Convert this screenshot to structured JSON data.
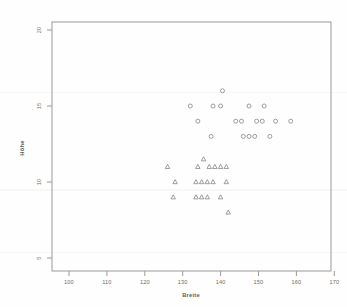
{
  "chart_data": {
    "type": "scatter",
    "title": "",
    "subtitle": "",
    "xlabel": "Breite",
    "ylabel": "Höhe",
    "xlim": [
      97,
      172
    ],
    "ylim": [
      4.2,
      20.6
    ],
    "xticks": [
      100,
      110,
      120,
      130,
      140,
      150,
      160,
      170
    ],
    "xticklabels": [
      "100",
      "110",
      "120",
      "130",
      "140",
      "150",
      "160",
      "170"
    ],
    "yticks": [
      5,
      10,
      15,
      20
    ],
    "yticklabels": [
      "5",
      "10",
      "15",
      "20"
    ],
    "grid": false,
    "legend": "none",
    "series": [
      {
        "name": "circles",
        "marker": "circle",
        "color": "#8d8d8d",
        "points": [
          [
            140.5,
            16.0
          ],
          [
            132.0,
            15.0
          ],
          [
            138.0,
            15.0
          ],
          [
            140.0,
            15.0
          ],
          [
            147.5,
            15.0
          ],
          [
            151.5,
            15.0
          ],
          [
            134.0,
            14.0
          ],
          [
            144.0,
            14.0
          ],
          [
            145.5,
            14.0
          ],
          [
            149.5,
            14.0
          ],
          [
            151.0,
            14.0
          ],
          [
            154.5,
            14.0
          ],
          [
            158.5,
            14.0
          ],
          [
            137.5,
            13.0
          ],
          [
            146.0,
            13.0
          ],
          [
            147.5,
            13.0
          ],
          [
            149.0,
            13.0
          ],
          [
            153.0,
            13.0
          ]
        ]
      },
      {
        "name": "triangles",
        "marker": "triangle",
        "color": "#8d8d8d",
        "points": [
          [
            135.5,
            11.5
          ],
          [
            126.0,
            11.0
          ],
          [
            134.0,
            11.0
          ],
          [
            137.0,
            11.0
          ],
          [
            138.5,
            11.0
          ],
          [
            140.0,
            11.0
          ],
          [
            141.5,
            11.0
          ],
          [
            128.0,
            10.0
          ],
          [
            133.5,
            10.0
          ],
          [
            135.0,
            10.0
          ],
          [
            136.5,
            10.0
          ],
          [
            138.0,
            10.0
          ],
          [
            141.5,
            10.0
          ],
          [
            127.5,
            9.0
          ],
          [
            133.5,
            9.0
          ],
          [
            135.0,
            9.0
          ],
          [
            136.5,
            9.0
          ],
          [
            140.0,
            9.0
          ],
          [
            142.0,
            8.0
          ]
        ]
      }
    ]
  },
  "geometry": {
    "frame": {
      "left": 52,
      "top": 22,
      "right": 331,
      "bottom": 271
    },
    "x_map": {
      "pixel_at_100": 69.0,
      "pixels_per_unit": 3.79
    },
    "y_map": {
      "pixel_at_5": 258.0,
      "pixels_per_unit": 15.2
    }
  }
}
